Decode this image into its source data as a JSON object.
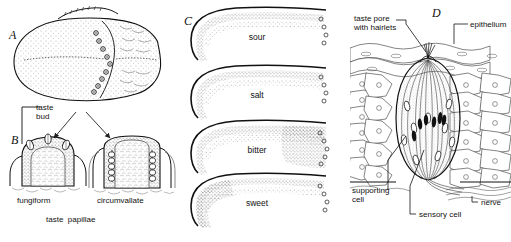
{
  "figure": {
    "background": "#ffffff",
    "ink": "#1a1a1a"
  },
  "panels": [
    {
      "letter": "A",
      "name": "tongue-dorsal-view",
      "description": "Dorsal surface of the tongue showing the V-shaped row of circumvallate papillae",
      "papillae_circle_count": 9
    },
    {
      "letter": "B",
      "name": "papillae-sections",
      "labels": {
        "taste_bud": "taste\nbud",
        "taste_bud_line1": "taste",
        "taste_bud_line2": "bud",
        "fungiform": "fungiform",
        "circumvallate": "circumvallate",
        "caption": "taste  papillae"
      }
    },
    {
      "letter": "C",
      "name": "taste-map-tongues",
      "tongues": [
        {
          "label": "sour",
          "name": "tongue-sour"
        },
        {
          "label": "salt",
          "name": "tongue-salt"
        },
        {
          "label": "bitter",
          "name": "tongue-bitter"
        },
        {
          "label": "sweet",
          "name": "tongue-sweet"
        }
      ]
    },
    {
      "letter": "D",
      "name": "taste-bud-histology",
      "labels": {
        "taste_pore_line1": "taste pore",
        "taste_pore_line2": "with hairlets",
        "epithelium": "epithelium",
        "supporting_line1": "supporting",
        "supporting_line2": "cell",
        "nerve": "nerve",
        "sensory_cell": "sensory cell"
      }
    }
  ]
}
